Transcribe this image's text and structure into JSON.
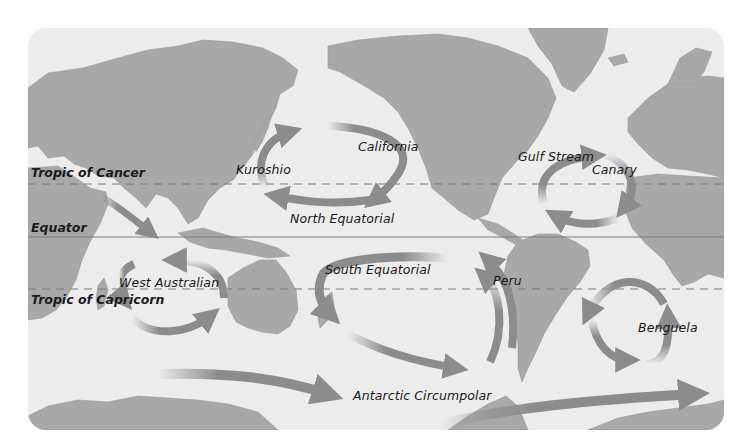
{
  "map": {
    "title": "Major Ocean Surface Currents",
    "colors": {
      "ocean": "#ececec",
      "land": "#a9a9a9",
      "land_dark": "#9a9a9a",
      "arrow": "#8c8c8c",
      "line": "#7a7a7a",
      "text": "#1a1a1a"
    },
    "latitude_lines": [
      {
        "name": "Tropic of Cancer",
        "style": "dashed"
      },
      {
        "name": "Equator",
        "style": "solid"
      },
      {
        "name": "Tropic of Capricorn",
        "style": "dashed"
      }
    ],
    "currents": [
      {
        "name": "Kuroshio"
      },
      {
        "name": "California"
      },
      {
        "name": "North Equatorial"
      },
      {
        "name": "Gulf Stream"
      },
      {
        "name": "Canary"
      },
      {
        "name": "West Australian"
      },
      {
        "name": "South Equatorial"
      },
      {
        "name": "Peru"
      },
      {
        "name": "Benguela"
      },
      {
        "name": "Antarctic Circumpolar"
      }
    ]
  }
}
